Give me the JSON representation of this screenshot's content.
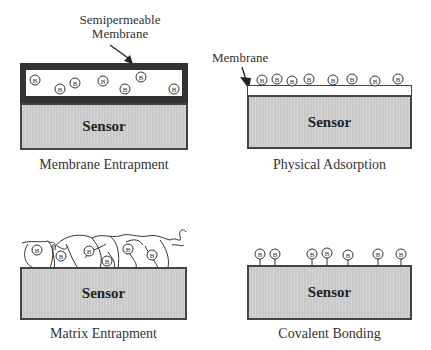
{
  "panels": {
    "membrane_entrapment": {
      "caption": "Membrane Entrapment",
      "sensor_label": "Sensor",
      "annotation_line1": "Semipermeable",
      "annotation_line2": "Membrane",
      "bio_label": "B"
    },
    "physical_adsorption": {
      "caption": "Physical Adsorption",
      "sensor_label": "Sensor",
      "annotation": "Membrane",
      "bio_label": "B"
    },
    "matrix_entrapment": {
      "caption": "Matrix Entrapment",
      "sensor_label": "Sensor",
      "bio_label": "B"
    },
    "covalent_bonding": {
      "caption": "Covalent Bonding",
      "sensor_label": "Sensor",
      "bio_label": "B"
    }
  },
  "colors": {
    "membrane_dark": "#333333",
    "sensor_fill": "#cfcfcf",
    "outline": "#444444"
  }
}
